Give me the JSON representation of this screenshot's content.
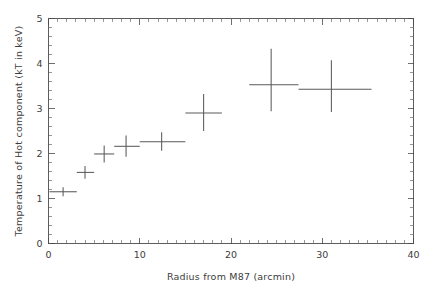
{
  "chart_data": {
    "type": "scatter",
    "title": "",
    "xlabel": "Radius from M87 (arcmin)",
    "ylabel": "Temperature of Hot component (kT in keV)",
    "xlim": [
      0,
      40
    ],
    "ylim": [
      0,
      5
    ],
    "grid": false,
    "legend": null,
    "xticks": [
      0,
      10,
      20,
      30,
      40
    ],
    "xtick_labels": [
      "0",
      "10",
      "20",
      "30",
      "40"
    ],
    "yticks": [
      0,
      1,
      2,
      3,
      4,
      5
    ],
    "ytick_labels": [
      "0",
      "1",
      "2",
      "3",
      "4",
      "5"
    ],
    "x_minor_tick_interval": 1,
    "y_minor_tick_interval": 0.2,
    "marker_style": "cross-errorbars",
    "series_name": "Hot component temperature",
    "points": [
      {
        "x": 1.6,
        "y": 1.15,
        "xlo": 0.1,
        "xhi": 3.1,
        "ylo": 1.05,
        "yhi": 1.25
      },
      {
        "x": 4.0,
        "y": 1.58,
        "xlo": 3.1,
        "xhi": 5.0,
        "ylo": 1.44,
        "yhi": 1.72
      },
      {
        "x": 6.1,
        "y": 1.99,
        "xlo": 5.0,
        "xhi": 7.2,
        "ylo": 1.8,
        "yhi": 2.18
      },
      {
        "x": 8.5,
        "y": 2.16,
        "xlo": 7.2,
        "xhi": 10.0,
        "ylo": 1.93,
        "yhi": 2.4
      },
      {
        "x": 12.4,
        "y": 2.26,
        "xlo": 10.0,
        "xhi": 15.0,
        "ylo": 2.06,
        "yhi": 2.47
      },
      {
        "x": 17.0,
        "y": 2.9,
        "xlo": 15.0,
        "xhi": 19.0,
        "ylo": 2.5,
        "yhi": 3.32
      },
      {
        "x": 24.4,
        "y": 3.53,
        "xlo": 22.0,
        "xhi": 27.4,
        "ylo": 2.94,
        "yhi": 4.33
      },
      {
        "x": 31.0,
        "y": 3.43,
        "xlo": 27.4,
        "xhi": 35.4,
        "ylo": 2.92,
        "yhi": 4.07
      }
    ]
  },
  "colors": {
    "background": "#ffffff",
    "axis": "#4a4a4a",
    "data": "#5a5a5a",
    "text": "#3c3c3c"
  }
}
